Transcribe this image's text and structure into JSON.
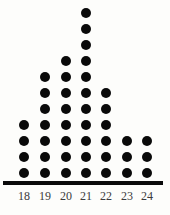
{
  "chart_data": {
    "type": "dotplot",
    "title": "",
    "subtitle": "",
    "xlabel": "",
    "ylabel": "",
    "categories": [
      "18",
      "19",
      "20",
      "21",
      "22",
      "23",
      "24"
    ],
    "values": [
      4,
      7,
      8,
      11,
      6,
      3,
      3
    ],
    "series": [
      {
        "name": "count",
        "values": [
          4,
          7,
          8,
          11,
          6,
          3,
          3
        ]
      }
    ],
    "total_count": 42,
    "xlim": [
      18,
      24
    ],
    "ylim": [
      0,
      11
    ],
    "grid": false,
    "legend": false,
    "legend_position": "none",
    "dot_color": "#0a0a0a",
    "axis_color": "#0a0a0a",
    "label_color": "#3b3b3b",
    "background_color": "#fdfdfb",
    "annotations": []
  },
  "axis": {
    "ticks": [
      {
        "label": "18",
        "count": 4
      },
      {
        "label": "19",
        "count": 7
      },
      {
        "label": "20",
        "count": 8
      },
      {
        "label": "21",
        "count": 11
      },
      {
        "label": "22",
        "count": 6
      },
      {
        "label": "23",
        "count": 3
      },
      {
        "label": "24",
        "count": 3
      }
    ]
  }
}
